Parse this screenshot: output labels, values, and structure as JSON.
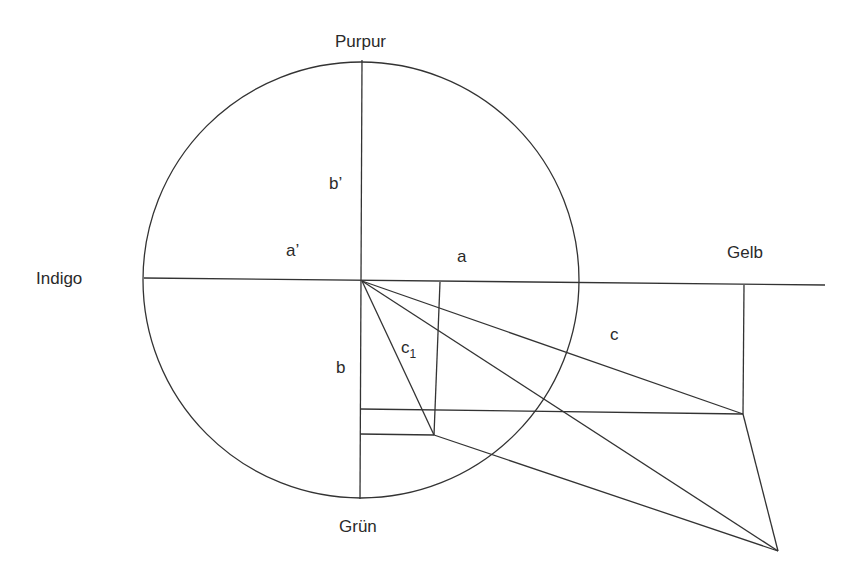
{
  "diagram": {
    "type": "color-circle-geometric-construction",
    "labels": {
      "top": "Purpur",
      "left": "Indigo",
      "right": "Gelb",
      "bottom": "Grün",
      "a_prime": "a’",
      "b_prime": "b’",
      "a": "a",
      "b": "b",
      "c": "c",
      "c1_base": "c",
      "c1_sub": "1"
    },
    "colors": {
      "stroke": "#333333",
      "text": "#2a2a2a",
      "background": "#ffffff"
    }
  }
}
